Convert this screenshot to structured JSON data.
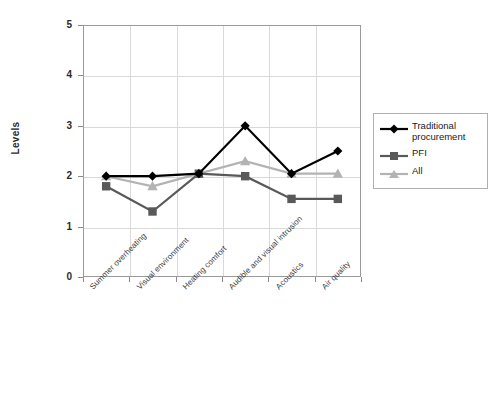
{
  "chart_data": {
    "type": "line",
    "title": "",
    "xlabel": "",
    "ylabel": "Levels",
    "ylim": [
      0,
      5
    ],
    "yticks": [
      0,
      1,
      2,
      3,
      4,
      5
    ],
    "grid": true,
    "legend_position": "right",
    "categories": [
      "Summer overheating",
      "Visual environment",
      "Heating comfort",
      "Audible and visual intrusion",
      "Acoustics",
      "Air quality"
    ],
    "series": [
      {
        "name": "Traditional procurement",
        "color": "#000000",
        "marker": "diamond",
        "values": [
          2.0,
          2.0,
          2.05,
          3.0,
          2.05,
          2.5
        ]
      },
      {
        "name": "PFI",
        "color": "#595959",
        "marker": "square",
        "values": [
          1.8,
          1.3,
          2.05,
          2.0,
          1.55,
          1.55
        ]
      },
      {
        "name": "All",
        "color": "#b3b3b3",
        "marker": "triangle",
        "values": [
          2.0,
          1.8,
          2.05,
          2.3,
          2.05,
          2.05
        ]
      }
    ]
  },
  "axes": {
    "y_title": "Levels",
    "y_tick_labels": [
      "5",
      "4",
      "3",
      "2",
      "1",
      "0"
    ]
  },
  "legend": {
    "entries": [
      {
        "label_line1": "Traditional",
        "label_line2": "procurement"
      },
      {
        "label_line1": "PFI",
        "label_line2": ""
      },
      {
        "label_line1": "All",
        "label_line2": ""
      }
    ]
  }
}
